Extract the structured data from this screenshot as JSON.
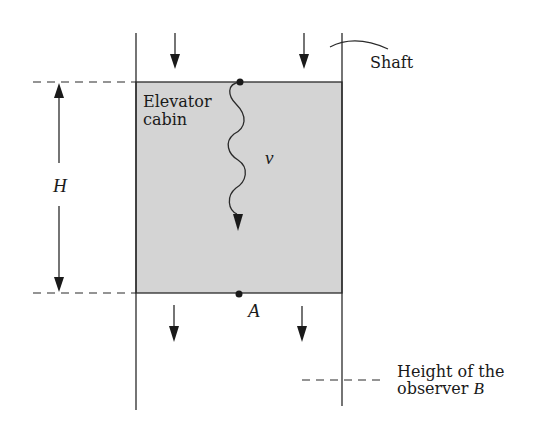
{
  "diagram": {
    "labels": {
      "shaft": "Shaft",
      "cabin_line1": "Elevator",
      "cabin_line2": "cabin",
      "frequency": "ν",
      "height": "H",
      "point_a": "A",
      "observer_line1": "Height of the",
      "observer_line2": "observer ",
      "observer_symbol": "B"
    },
    "colors": {
      "line": "#2a2a2a",
      "cabin_fill": "#d4d4d4",
      "background": "#ffffff"
    },
    "elements": {
      "shaft_walls": [
        "left-wall",
        "right-wall"
      ],
      "cabin": "gray-rectangle",
      "downward_arrows_above_cabin": 2,
      "downward_arrows_below_cabin": 2,
      "wavy_photon": "from top of cabin downward",
      "points": [
        "top-emitter",
        "A"
      ],
      "dimension": "H between top and bottom of cabin",
      "observer_level": "dashed line below cabin"
    }
  }
}
